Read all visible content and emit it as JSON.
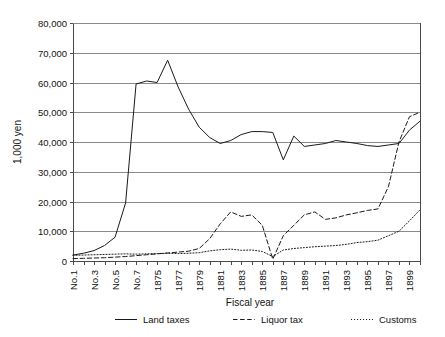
{
  "chart_data": {
    "type": "line",
    "title": "",
    "xlabel": "Fiscal year",
    "ylabel": "1,000 yen",
    "ylim": [
      0,
      80000
    ],
    "ytick_labels": [
      "0",
      "10,000",
      "20,000",
      "30,000",
      "40,000",
      "50,000",
      "60,000",
      "70,000",
      "80,000"
    ],
    "ytick_values": [
      0,
      10000,
      20000,
      30000,
      40000,
      50000,
      60000,
      70000,
      80000
    ],
    "grid": true,
    "legend_position": "bottom",
    "categories": [
      "No.1",
      "No.2",
      "No.3",
      "No.4",
      "No.5",
      "No.6",
      "No.7",
      "1874",
      "1875",
      "1876",
      "1877",
      "1878",
      "1879",
      "1880",
      "1881",
      "1882",
      "1883",
      "1884",
      "1885",
      "1886",
      "1887",
      "1888",
      "1889",
      "1890",
      "1891",
      "1892",
      "1893",
      "1894",
      "1895",
      "1896",
      "1897",
      "1898",
      "1899",
      "1900"
    ],
    "xtick_labels": [
      "No.1",
      "",
      "No.3",
      "",
      "No.5",
      "",
      "No.7",
      "",
      "1875",
      "",
      "1877",
      "",
      "1879",
      "",
      "1881",
      "",
      "1883",
      "",
      "1885",
      "",
      "1887",
      "",
      "1889",
      "",
      "1891",
      "",
      "1893",
      "",
      "1895",
      "",
      "1897",
      "",
      "1899",
      ""
    ],
    "series": [
      {
        "name": "Land taxes",
        "style": "solid",
        "values": [
          2000,
          2600,
          3500,
          5200,
          8000,
          19500,
          59500,
          60500,
          60000,
          67500,
          58500,
          51000,
          45000,
          41500,
          39500,
          40500,
          42500,
          43500,
          43500,
          43200,
          34000,
          42000,
          38500,
          39000,
          39500,
          40500,
          40000,
          39500,
          38800,
          38500,
          39000,
          39500,
          44000,
          47000
        ]
      },
      {
        "name": "Liquor tax",
        "style": "dashed",
        "values": [
          800,
          900,
          1000,
          1100,
          1300,
          1500,
          1800,
          2100,
          2400,
          2700,
          3000,
          3300,
          4200,
          7500,
          12500,
          16500,
          15000,
          15500,
          12000,
          600,
          8500,
          12000,
          15500,
          16500,
          14000,
          14500,
          15500,
          16200,
          17000,
          17500,
          25000,
          40000,
          48500,
          50000
        ]
      },
      {
        "name": "Customs",
        "style": "dotted",
        "values": [
          1900,
          2000,
          2100,
          2200,
          2300,
          2400,
          2300,
          2400,
          2500,
          2600,
          2500,
          2600,
          2800,
          3400,
          3800,
          4000,
          3600,
          3700,
          3200,
          1500,
          3700,
          4200,
          4500,
          4800,
          5000,
          5200,
          5600,
          6200,
          6500,
          7000,
          8500,
          10000,
          13500,
          17200
        ]
      }
    ]
  },
  "legend": {
    "items": [
      {
        "label": "Land taxes",
        "style": "solid"
      },
      {
        "label": "Liquor tax",
        "style": "dashed"
      },
      {
        "label": "Customs",
        "style": "dotted"
      }
    ]
  }
}
